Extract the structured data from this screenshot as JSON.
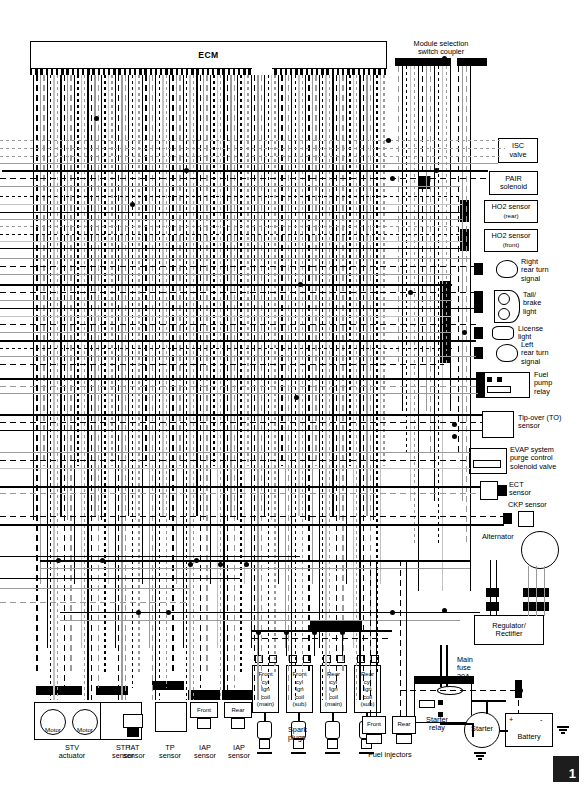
{
  "diagram": {
    "page_marker": "1",
    "ecm": {
      "label": "ECM"
    },
    "module_coupler": {
      "label_line1": "Module selection",
      "label_line2": "switch coupler"
    }
  },
  "right_components": [
    {
      "name": "isc-valve",
      "lines": [
        "ISC",
        "valve"
      ]
    },
    {
      "name": "pair-solenoid",
      "lines": [
        "PAIR",
        "solenoid"
      ]
    },
    {
      "name": "ho2-sensor-rear",
      "lines": [
        "HO2 sensor",
        "(rear)"
      ]
    },
    {
      "name": "ho2-sensor-front",
      "lines": [
        "HO2 sensor",
        "(front)"
      ]
    },
    {
      "name": "right-rear-turn-signal",
      "lines": [
        "Right",
        "rear turn",
        "signal"
      ]
    },
    {
      "name": "tail-brake-light",
      "lines": [
        "Tail/",
        "brake",
        "light"
      ]
    },
    {
      "name": "license-light",
      "lines": [
        "License",
        "light"
      ]
    },
    {
      "name": "left-rear-turn-signal",
      "lines": [
        "Left",
        "rear turn",
        "signal"
      ]
    },
    {
      "name": "fuel-pump-relay",
      "lines": [
        "Fuel",
        "pump",
        "relay"
      ]
    },
    {
      "name": "tip-over-sensor",
      "lines": [
        "Tip-over (TO)",
        "sensor"
      ]
    },
    {
      "name": "evap-purge-valve",
      "lines": [
        "EVAP system",
        "purge control",
        "solenoid valve"
      ]
    },
    {
      "name": "ect-sensor",
      "lines": [
        "ECT",
        "sensor"
      ]
    },
    {
      "name": "ckp-sensor",
      "lines": [
        "CKP sensor"
      ]
    },
    {
      "name": "alternator",
      "lines": [
        "Alternator"
      ]
    },
    {
      "name": "regulator-rectifier",
      "lines": [
        "Regulator/",
        "Rectifier"
      ]
    },
    {
      "name": "main-fuse",
      "lines": [
        "Main",
        "fuse",
        "30A"
      ]
    },
    {
      "name": "starter-relay",
      "lines": [
        "Starter",
        "relay"
      ]
    },
    {
      "name": "starter",
      "lines": [
        "Starter"
      ]
    },
    {
      "name": "battery",
      "lines": [
        "Battery"
      ],
      "terminal_positive": "+",
      "terminal_negative": "-"
    }
  ],
  "bottom_components": [
    {
      "name": "stv-actuator",
      "lines": [
        "STV",
        "actuator"
      ],
      "inner": [
        "Motor",
        "Motor"
      ]
    },
    {
      "name": "stp-sensor",
      "lines": [
        "STP",
        "sensor"
      ]
    },
    {
      "name": "iat-sensor",
      "lines": [
        "IAT",
        "sensor"
      ]
    },
    {
      "name": "tp-sensor",
      "lines": [
        "TP",
        "sensor"
      ]
    },
    {
      "name": "iap-sensor-front",
      "lines": [
        "IAP",
        "sensor"
      ],
      "inner": [
        "Front"
      ]
    },
    {
      "name": "iap-sensor-rear",
      "lines": [
        "IAP",
        "sensor"
      ],
      "inner": [
        "Rear"
      ]
    }
  ],
  "ignition_coils": [
    {
      "name": "front-cyl-ign-coil-main",
      "lines": [
        "Front",
        "cyl",
        "Ign",
        "coil",
        "(main)"
      ]
    },
    {
      "name": "front-cyl-ign-coil-sub",
      "lines": [
        "Front",
        "cyl",
        "Ign",
        "coil",
        "(sub)"
      ]
    },
    {
      "name": "rear-cyl-ign-coil-main",
      "lines": [
        "Rear",
        "cyl",
        "Ign",
        "coil",
        "(main)"
      ]
    },
    {
      "name": "rear-cyl-ign-coil-sub",
      "lines": [
        "Rear",
        "cyl",
        "Ign",
        "coil",
        "(sub)"
      ]
    }
  ],
  "labels": {
    "spark_plugs": "Spark\nplugs",
    "spark_plugs_l1": "Spark",
    "spark_plugs_l2": "plugs",
    "fuel_injectors": "Fuel injectors",
    "injector_front": "Front",
    "injector_rear": "Rear"
  },
  "colors": {
    "wire_black": "#000000",
    "wire_gray": "#9a9a9a",
    "wire_light_gray": "#c2c2c2",
    "background": "#ffffff",
    "tab_marker": "#1d1d1d"
  }
}
